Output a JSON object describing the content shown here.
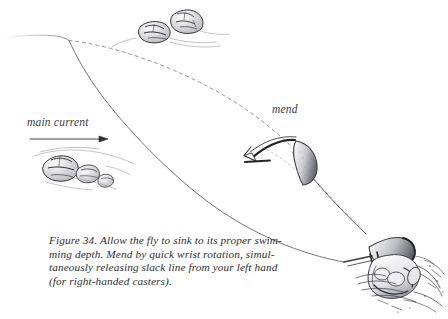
{
  "figure": {
    "number": "Figure 34.",
    "caption_lines": [
      "Figure 34. Allow the fly to sink to its proper swim-",
      "ming depth. Mend by quick wrist rotation, simul-",
      "taneously releasing slack line from your left hand",
      "(for right-handed casters)."
    ],
    "medium": "pen-and-ink line drawing",
    "background_color": "#ffffff",
    "ink_color": "#333338",
    "faint_ink_color": "#9a9aa2"
  },
  "labels": {
    "main_current": "main current",
    "mend": "mend"
  },
  "annotations": {
    "current_arrow": "horizontal-arrow-pointing-right",
    "mend_arrow": "curved-sweep-arrow-counterclockwise"
  },
  "scene": {
    "elements": [
      "water-surface-line",
      "fly-line-solid-sunken",
      "fly-line-dashed-drifted",
      "rod-tip-mend-loop",
      "casters-hand-gripping-rod",
      "fly-reel",
      "stream-boulder-upper-left",
      "stream-boulder-upper-right",
      "stream-boulder-lower-cluster",
      "water-splash-texture"
    ]
  }
}
